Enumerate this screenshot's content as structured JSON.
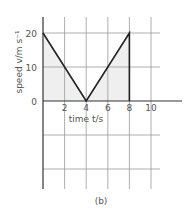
{
  "figure_label": "(b)",
  "chart_data": {
    "type": "line",
    "title": "",
    "xlabel": "time t/s",
    "ylabel": "speed v/m s⁻¹",
    "x": [
      0,
      4,
      8,
      8
    ],
    "series": [
      {
        "name": "speed",
        "x": [
          0,
          4,
          8,
          8
        ],
        "values": [
          20,
          0,
          20,
          0
        ]
      }
    ],
    "shaded_area": {
      "x_from": 0,
      "x_to": 8,
      "under": "speed"
    },
    "x_ticks": [
      2,
      4,
      6,
      8,
      10
    ],
    "y_ticks": [
      0,
      10,
      20
    ],
    "xlim": [
      0,
      11
    ],
    "ylim": [
      -20,
      20
    ],
    "grid": true,
    "legend": null
  },
  "colors": {
    "line": "#222222",
    "grid": "#999999",
    "fill": "#efefef",
    "axis": "#333333",
    "text": "#555555"
  }
}
